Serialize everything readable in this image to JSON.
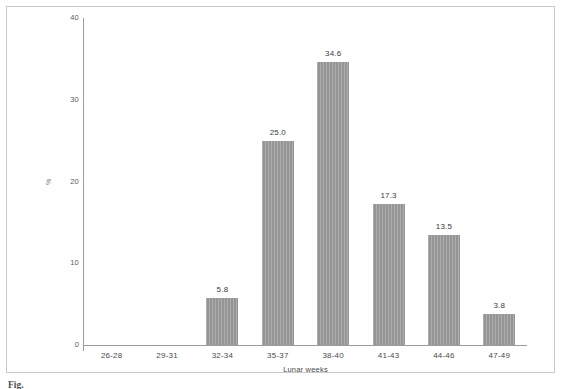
{
  "figure": {
    "caption_label": "Fig.",
    "caption_text": ""
  },
  "chart_data": {
    "type": "bar",
    "title": "",
    "subtitle": "",
    "xlabel": "Lunar weeks",
    "ylabel": "%",
    "categories": [
      "26-28",
      "29-31",
      "32-34",
      "35-37",
      "38-40",
      "41-43",
      "44-46",
      "47-49"
    ],
    "values": [
      0,
      0,
      5.8,
      25.0,
      34.6,
      17.3,
      13.5,
      3.8
    ],
    "data_labels": [
      "",
      "",
      "5.8",
      "25.0",
      "34.6",
      "17.3",
      "13.5",
      "3.8"
    ],
    "ylim": [
      0,
      40
    ],
    "yticks": [
      0,
      10,
      20,
      30,
      40
    ],
    "ytick_labels": [
      "0",
      "10",
      "20",
      "30",
      "40"
    ],
    "grid": false,
    "legend": false,
    "legend_position": "none",
    "bar_color": "#9d9d9d",
    "axis_color": "#9b9b9b",
    "frame_color": "#c9c9c9"
  }
}
